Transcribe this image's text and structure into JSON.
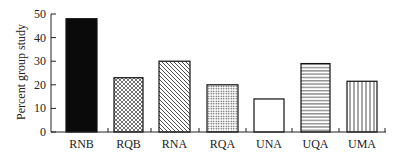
{
  "chart_data": {
    "type": "bar",
    "title": "",
    "xlabel": "",
    "ylabel": "Percent group study",
    "ylim": [
      0,
      50
    ],
    "yticks": [
      0,
      10,
      20,
      30,
      40,
      50
    ],
    "grid": false,
    "legend": null,
    "categories": [
      "RNB",
      "RQB",
      "RNA",
      "RQA",
      "UNA",
      "UQA",
      "UMA"
    ],
    "values": [
      48,
      23,
      30,
      20,
      14,
      29,
      21.5
    ],
    "patterns": [
      "solid-black",
      "crosshatch",
      "diagonal-hatch",
      "dots",
      "empty",
      "horizontal-lines",
      "vertical-lines"
    ]
  }
}
